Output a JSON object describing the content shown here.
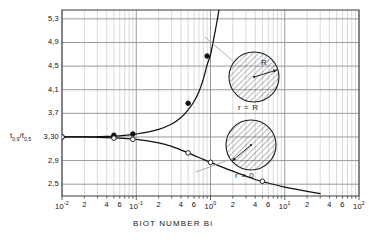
{
  "figure": {
    "x_axis_title": "BIOT NUMBER   Bi",
    "y_axis_title_num": "t",
    "y_axis_title_num_sub": "0,9",
    "y_axis_title_slash": "/t",
    "y_axis_title_den_sub": "0,5",
    "background_color": "#ffffff",
    "grid_color": "#8f8f96",
    "minor_grid_color": "#b9b9c0",
    "axis_color": "#3b3b42",
    "curve_color": "#111111"
  },
  "insets": [
    {
      "id": "inset-r-equals-R",
      "caption": "r = R",
      "radius_label": "R",
      "cx": 254,
      "cy": 77,
      "radius": 25,
      "arrow_from_x": 254,
      "arrow_from_y": 77,
      "arrow_to_x": 277,
      "arrow_to_y": 70,
      "label_x": 261,
      "label_y": 63,
      "caption_x": 254,
      "caption_y": 108,
      "leader_x1": 205,
      "leader_y1": 37,
      "leader_x2": 233,
      "leader_y2": 61
    },
    {
      "id": "inset-r-equals-0",
      "caption": "r = 0",
      "radius_label": "",
      "cx": 251,
      "cy": 145,
      "radius": 25,
      "arrow_from_x": 251,
      "arrow_from_y": 145,
      "arrow_to_x": 232,
      "arrow_to_y": 161,
      "label_x": 0,
      "label_y": 0,
      "caption_x": 251,
      "caption_y": 176,
      "leader_x1": 196,
      "leader_y1": 172,
      "leader_x2": 228,
      "leader_y2": 160
    }
  ],
  "chart_data": {
    "type": "line",
    "title": "",
    "subtitle": "",
    "xlabel": "BIOT NUMBER   Bi",
    "ylabel": "t0,9 / t0,5",
    "xscale": "log",
    "yscale": "linear",
    "xlim": [
      0.01,
      100.0
    ],
    "ylim": [
      2.3,
      5.45
    ],
    "grid": true,
    "legend_position": "none",
    "x_tick_labels": [
      {
        "value": 0.01,
        "text": "10",
        "exp": "-2"
      },
      {
        "value": 0.02,
        "text": "2",
        "exp": ""
      },
      {
        "value": 0.04,
        "text": "4",
        "exp": ""
      },
      {
        "value": 0.06,
        "text": "6",
        "exp": ""
      },
      {
        "value": 0.1,
        "text": "10",
        "exp": "-1"
      },
      {
        "value": 0.2,
        "text": "2",
        "exp": ""
      },
      {
        "value": 0.4,
        "text": "4",
        "exp": ""
      },
      {
        "value": 0.6,
        "text": "6",
        "exp": ""
      },
      {
        "value": 1.0,
        "text": "10",
        "exp": "0"
      },
      {
        "value": 2.0,
        "text": "2",
        "exp": ""
      },
      {
        "value": 4.0,
        "text": "4",
        "exp": ""
      },
      {
        "value": 6.0,
        "text": "6",
        "exp": ""
      },
      {
        "value": 10.0,
        "text": "10",
        "exp": "1"
      },
      {
        "value": 20.0,
        "text": "2",
        "exp": ""
      },
      {
        "value": 40.0,
        "text": "4",
        "exp": ""
      },
      {
        "value": 60.0,
        "text": "6",
        "exp": ""
      },
      {
        "value": 100.0,
        "text": "10",
        "exp": "2"
      }
    ],
    "y_tick_labels": [
      {
        "value": 5.3,
        "text": "5,3"
      },
      {
        "value": 4.9,
        "text": "4,9"
      },
      {
        "value": 4.5,
        "text": "4,5"
      },
      {
        "value": 4.1,
        "text": "4,1"
      },
      {
        "value": 3.7,
        "text": "3,7"
      },
      {
        "value": 3.3,
        "text": "3,30"
      },
      {
        "value": 2.9,
        "text": "2,9"
      },
      {
        "value": 2.5,
        "text": "2,5"
      }
    ],
    "series": [
      {
        "name": "r = R",
        "marker": "filled-circle",
        "x": [
          0.01,
          0.02,
          0.04,
          0.06,
          0.1,
          0.2,
          0.3,
          0.4,
          0.5,
          0.6,
          0.7,
          0.8,
          0.9,
          1.0,
          1.1,
          1.2,
          1.3
        ],
        "y": [
          3.3,
          3.3,
          3.31,
          3.32,
          3.35,
          3.43,
          3.52,
          3.63,
          3.76,
          3.9,
          4.07,
          4.28,
          4.52,
          4.69,
          4.95,
          5.2,
          5.45
        ],
        "markers": [
          {
            "x": 0.01,
            "y": 3.3
          },
          {
            "x": 0.05,
            "y": 3.33
          },
          {
            "x": 0.09,
            "y": 3.35
          },
          {
            "x": 0.5,
            "y": 3.87
          },
          {
            "x": 0.9,
            "y": 4.67
          }
        ]
      },
      {
        "name": "r = 0",
        "marker": "open-circle",
        "x": [
          0.01,
          0.02,
          0.04,
          0.06,
          0.1,
          0.2,
          0.3,
          0.5,
          0.8,
          1.0,
          2.0,
          4.0,
          6.0,
          10.0,
          20.0,
          30.0
        ],
        "y": [
          3.3,
          3.3,
          3.29,
          3.28,
          3.26,
          3.2,
          3.14,
          3.03,
          2.92,
          2.87,
          2.72,
          2.58,
          2.52,
          2.45,
          2.38,
          2.34
        ],
        "markers": [
          {
            "x": 0.01,
            "y": 3.3
          },
          {
            "x": 0.05,
            "y": 3.28
          },
          {
            "x": 0.09,
            "y": 3.26
          },
          {
            "x": 0.5,
            "y": 3.03
          },
          {
            "x": 1.0,
            "y": 2.87
          },
          {
            "x": 5.0,
            "y": 2.55
          }
        ]
      }
    ]
  }
}
